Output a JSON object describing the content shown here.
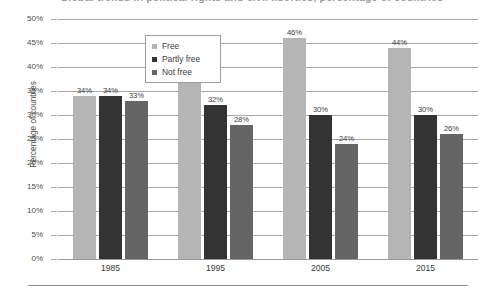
{
  "title_fragment": "Global trends in political rights and civil liberties, percentage of countries",
  "axis": {
    "y_title": "Percentage of countries",
    "y_ticks": [
      "50%",
      "45%",
      "40%",
      "35%",
      "30%",
      "25%",
      "20%",
      "15%",
      "10%",
      "5%",
      "0%"
    ]
  },
  "legend": {
    "items": [
      {
        "label": "Free",
        "color": "#b5b5b5"
      },
      {
        "label": "Partly free",
        "color": "#333333"
      },
      {
        "label": "Not free",
        "color": "#656565"
      }
    ]
  },
  "chart_data": {
    "type": "bar",
    "title": "",
    "xlabel": "",
    "ylabel": "Percentage of countries",
    "ylim": [
      0,
      50
    ],
    "ytick_step": 5,
    "grid": true,
    "legend_position": "top-left",
    "categories": [
      "1985",
      "1995",
      "2005",
      "2015"
    ],
    "series": [
      {
        "name": "Free",
        "color": "#b5b5b5",
        "values": [
          34,
          40,
          46,
          44
        ],
        "labels": [
          "34%",
          "40%",
          "46%",
          "44%"
        ]
      },
      {
        "name": "Partly free",
        "color": "#333333",
        "values": [
          34,
          32,
          30,
          30
        ],
        "labels": [
          "34%",
          "32%",
          "30%",
          "30%"
        ]
      },
      {
        "name": "Not free",
        "color": "#656565",
        "values": [
          33,
          28,
          24,
          26
        ],
        "labels": [
          "33%",
          "28%",
          "24%",
          "26%"
        ]
      }
    ]
  }
}
